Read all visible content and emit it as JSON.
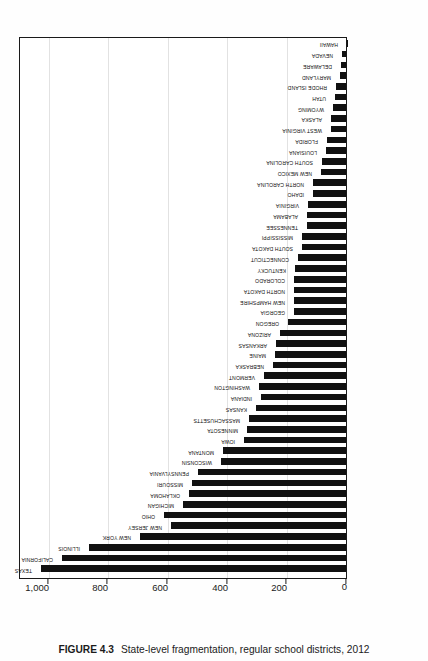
{
  "figure": {
    "number": "FIGURE 4.3",
    "caption": "State-level fragmentation, regular school districts, 2012"
  },
  "chart_data": {
    "type": "bar",
    "orientation": "vertical-rotated",
    "title": "State-level fragmentation, regular school districts, 2012",
    "xlabel": "",
    "ylabel": "",
    "grid": true,
    "legend": "none",
    "ylim": [
      0,
      1100
    ],
    "tick_values": [
      0,
      200,
      400,
      600,
      800,
      1000
    ],
    "tick_labels": [
      "0",
      "200",
      "400",
      "600",
      "800",
      "1,000"
    ],
    "categories": [
      "TEXAS",
      "CALIFORNIA",
      "ILLINOIS",
      "NEW YORK",
      "NEW JERSEY",
      "OHIO",
      "MICHIGAN",
      "OKLAHOMA",
      "MISSOURI",
      "PENNSYLVANIA",
      "WISCONSIN",
      "MONTANA",
      "IOWA",
      "MINNESOTA",
      "MASSACHUSETTS",
      "KANSAS",
      "INDIANA",
      "WASHINGTON",
      "VERMONT",
      "NEBRASKA",
      "MAINE",
      "ARKANSAS",
      "ARIZONA",
      "OREGON",
      "GEORGIA",
      "NEW HAMPSHIRE",
      "NORTH DAKOTA",
      "COLORADO",
      "KENTUCKY",
      "CONNECTICUT",
      "SOUTH DAKOTA",
      "MISSISSIPPI",
      "TENNESSEE",
      "ALABAMA",
      "VIRGINIA",
      "IDAHO",
      "NORTH CAROLINA",
      "NEW MEXICO",
      "SOUTH CAROLINA",
      "LOUISIANA",
      "FLORIDA",
      "WEST VIRGINIA",
      "ALASKA",
      "WYOMING",
      "UTAH",
      "RHODE ISLAND",
      "MARYLAND",
      "DELAWARE",
      "NEVADA",
      "HAWAII"
    ],
    "values": [
      1029,
      958,
      868,
      697,
      591,
      614,
      551,
      531,
      521,
      500,
      424,
      416,
      348,
      338,
      329,
      306,
      291,
      295,
      280,
      249,
      243,
      239,
      227,
      197,
      180,
      178,
      178,
      178,
      174,
      166,
      152,
      152,
      136,
      134,
      132,
      115,
      115,
      89,
      85,
      70,
      67,
      55,
      53,
      48,
      41,
      36,
      24,
      19,
      17,
      1
    ]
  }
}
